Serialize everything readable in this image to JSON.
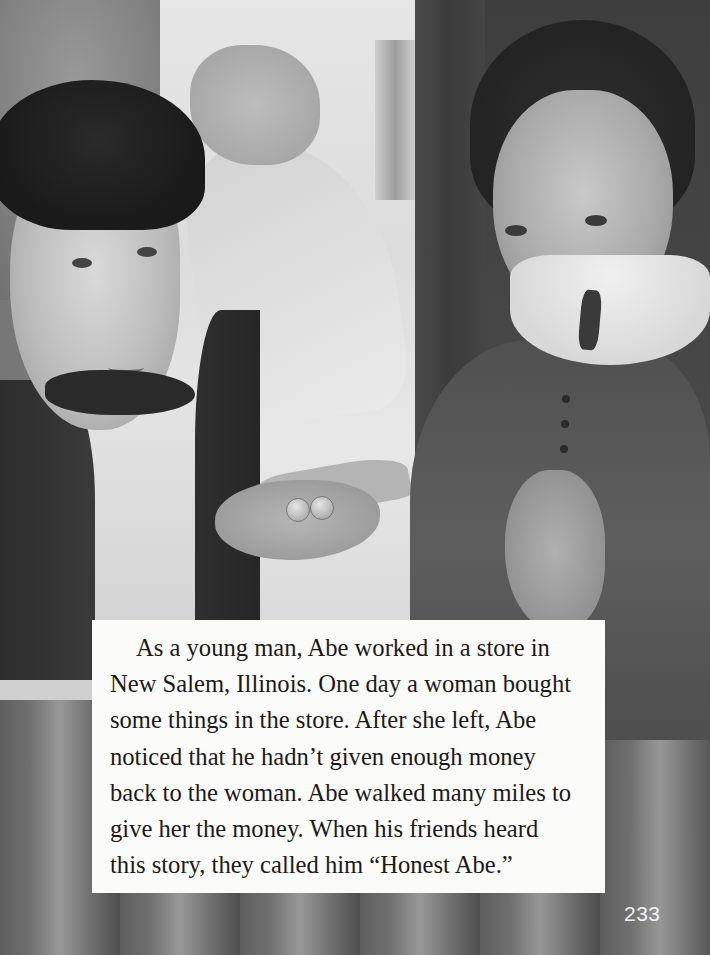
{
  "page": {
    "illustration": {
      "description": "Grayscale painting: young Abe in a vest and bow tie holding out coins and paper money to a woman with a white lace collar",
      "figures": [
        "abe",
        "woman"
      ],
      "colors": {
        "text_box_bg": "#fbfbfa",
        "text_color": "#1a1a1a",
        "page_number_color": "#f2f2f2"
      }
    },
    "story": {
      "lines": [
        "As a young man, Abe worked in a store in",
        "New Salem, Illinois. One day a woman bought",
        "some things in the store. After she left, Abe",
        "noticed that he hadn’t given enough money",
        "back to the woman. Abe walked many miles to",
        "give her the money. When his friends heard",
        "this story, they called him “Honest Abe.”"
      ]
    },
    "page_number": "233"
  }
}
